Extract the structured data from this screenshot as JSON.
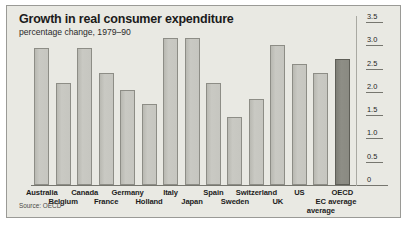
{
  "chart_data": {
    "type": "bar",
    "title": "Growth in real consumer expenditure",
    "subtitle": "percentage change, 1979–90",
    "source": "Source: OECD",
    "xlabel": "",
    "ylabel": "",
    "ylim": [
      0,
      3.5
    ],
    "ytick_labels": [
      "3.5",
      "3.0",
      "2.5",
      "2.0",
      "1.5",
      "1.0",
      "0.5",
      "0"
    ],
    "ytick_values": [
      3.5,
      3.0,
      2.5,
      2.0,
      1.5,
      1.0,
      0.5,
      0
    ],
    "grid": false,
    "legend": "none",
    "axis_side": "right",
    "categories": [
      "Australia",
      "Belgium",
      "Canada",
      "France",
      "Germany",
      "Holland",
      "Italy",
      "Japan",
      "Spain",
      "Sweden",
      "Switzerland",
      "UK",
      "US",
      "EC average",
      "OECD average"
    ],
    "values": [
      2.95,
      2.2,
      2.95,
      2.4,
      2.05,
      1.75,
      3.15,
      3.15,
      2.2,
      1.45,
      1.85,
      3.0,
      2.6,
      2.4,
      2.7
    ],
    "highlight_index": 14,
    "colors": {
      "bar_fill": "#c3c3bd",
      "bar_border": "#8d8d86",
      "highlight_fill": "#87877f",
      "highlight_border": "#5e5e57",
      "panel_background": "#e9e9e3",
      "axis": "#76766f",
      "text": "#1b1b1b"
    }
  }
}
